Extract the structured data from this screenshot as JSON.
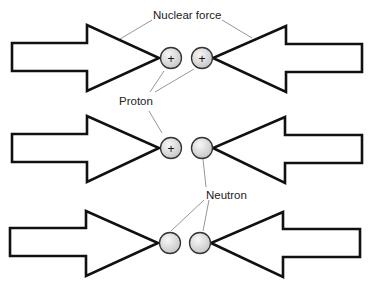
{
  "diagram": {
    "labels": {
      "nuclear_force": "Nuclear force",
      "proton": "Proton",
      "neutron": "Neutron"
    },
    "proton_sign": "+",
    "rows": [
      {
        "name": "proton-proton",
        "particles": [
          "proton",
          "proton"
        ]
      },
      {
        "name": "proton-neutron",
        "particles": [
          "proton",
          "neutron"
        ]
      },
      {
        "name": "neutron-neutron",
        "particles": [
          "neutron",
          "neutron"
        ]
      }
    ],
    "colors": {
      "arrow_stroke": "#111111",
      "arrow_fill": "#ffffff",
      "particle_fill": "#d9d9d9",
      "leader_line": "#8a8a8a"
    }
  }
}
